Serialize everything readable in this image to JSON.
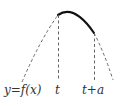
{
  "diagram": {
    "curve_label": "y=f(x)",
    "tick_left": "t",
    "tick_right": "t+a",
    "colors": {
      "stroke": "#222222",
      "dashed": "#555555",
      "text": "#333333"
    }
  }
}
